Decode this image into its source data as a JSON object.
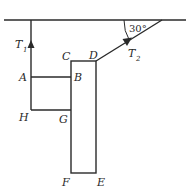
{
  "diagram": {
    "labels": {
      "A": "A",
      "B": "B",
      "C": "C",
      "D": "D",
      "E": "E",
      "F": "F",
      "G": "G",
      "H": "H"
    },
    "tensions": {
      "t1": {
        "main": "T",
        "sub": "1"
      },
      "t2": {
        "main": "T",
        "sub": "2"
      }
    },
    "angle": "30°"
  }
}
